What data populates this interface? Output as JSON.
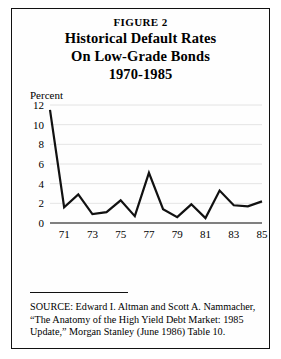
{
  "figure": {
    "number_label": "FIGURE 2",
    "title_lines": [
      "Historical Default Rates",
      "On Low-Grade Bonds",
      "1970-1985"
    ]
  },
  "source": {
    "lines": [
      "SOURCE: Edward I. Altman and Scott A. Nammacher,",
      "“The Anatomy of the High Yield Debt Market: 1985",
      "Update,” Morgan Stanley (June 1986) Table 10."
    ]
  },
  "colors": {
    "ink": "#000000",
    "line": "#111111",
    "grid": "#dddddd",
    "paper": "#fefefe"
  },
  "chart_data": {
    "type": "line",
    "title": "Historical Default Rates On Low-Grade Bonds 1970-1985",
    "xlabel": "",
    "ylabel": "Percent",
    "ylim": [
      0,
      12
    ],
    "xlim": [
      1970,
      1985
    ],
    "grid": true,
    "legend": "none",
    "yticks": [
      0,
      2,
      4,
      6,
      8,
      10,
      12
    ],
    "ytick_labels": [
      "0",
      "2",
      "4",
      "6",
      "8",
      "10",
      "12"
    ],
    "xticks": [
      1971,
      1973,
      1975,
      1977,
      1979,
      1981,
      1983,
      1985
    ],
    "xtick_labels": [
      "71",
      "73",
      "75",
      "77",
      "79",
      "81",
      "83",
      "85"
    ],
    "x": [
      1970,
      1971,
      1972,
      1973,
      1974,
      1975,
      1976,
      1977,
      1978,
      1979,
      1980,
      1981,
      1982,
      1983,
      1984,
      1985
    ],
    "values": [
      11.5,
      1.6,
      2.9,
      0.9,
      1.1,
      2.3,
      0.7,
      5.1,
      1.4,
      0.6,
      1.9,
      0.5,
      3.3,
      1.8,
      1.7,
      2.2
    ],
    "series_name": "Default rate (percent)"
  }
}
